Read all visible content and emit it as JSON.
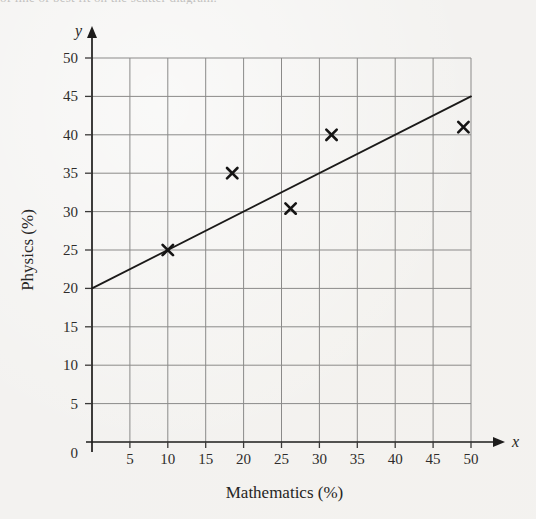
{
  "page": {
    "top_cut_text": "of line of best fit on the scatter diagram."
  },
  "figure": {
    "name": "scatter-diagram-with-line-of-best-fit"
  },
  "chart_data": {
    "type": "scatter",
    "title": "",
    "subtitle": "",
    "xlabel": "Mathematics (%)",
    "ylabel": "Physics (%)",
    "x_axis_variable": "x",
    "y_axis_variable": "y",
    "origin_label": "0",
    "xlim": [
      0,
      50
    ],
    "ylim": [
      0,
      50
    ],
    "xticks": [
      0,
      5,
      10,
      15,
      20,
      25,
      30,
      35,
      40,
      45,
      50
    ],
    "xtick_labels": [
      "0",
      "5",
      "10",
      "15",
      "20",
      "25",
      "30",
      "35",
      "40",
      "45",
      "50"
    ],
    "yticks": [
      0,
      5,
      10,
      15,
      20,
      25,
      30,
      35,
      40,
      45,
      50
    ],
    "ytick_labels": [
      "0",
      "5",
      "10",
      "15",
      "20",
      "25",
      "30",
      "35",
      "40",
      "45",
      "50"
    ],
    "grid": true,
    "grid_color": "#8b8a89",
    "legend": false,
    "marker_style": "x",
    "marker_color": "#151414",
    "points": [
      {
        "x": 10,
        "y": 25
      },
      {
        "x": 18.5,
        "y": 35
      },
      {
        "x": 26.2,
        "y": 30.4
      },
      {
        "x": 31.6,
        "y": 40
      },
      {
        "x": 49,
        "y": 41
      }
    ],
    "series": [
      {
        "name": "Students",
        "type": "scatter",
        "x": [
          10,
          18.5,
          26.2,
          31.6,
          49
        ],
        "y": [
          25,
          35,
          30.4,
          40,
          41
        ]
      },
      {
        "name": "Line of best fit",
        "type": "line",
        "color": "#1b1a19",
        "x": [
          0,
          50
        ],
        "y": [
          20,
          45
        ],
        "intercept": 20,
        "slope": 0.5
      }
    ],
    "annotations": []
  }
}
